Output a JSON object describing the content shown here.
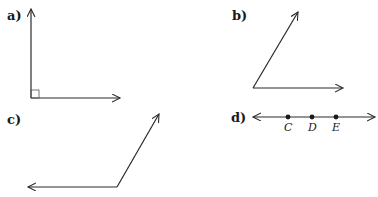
{
  "figures": [
    {
      "label": "a)",
      "description": "right angle with square marker"
    },
    {
      "label": "b)",
      "description": "acute angle"
    },
    {
      "label": "c)",
      "description": "obtuse angle"
    },
    {
      "label": "d)",
      "description": "line with three points",
      "points": [
        "C",
        "D",
        "E"
      ]
    }
  ],
  "colors": {
    "stroke": "#2a2a2a",
    "background": "#ffffff"
  }
}
